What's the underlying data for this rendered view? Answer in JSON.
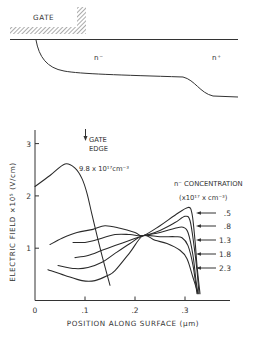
{
  "diagram": {
    "gate_label": "GATE",
    "n_minus_label": "n⁻",
    "n_plus_label": "n⁺"
  },
  "chart_data": {
    "type": "line",
    "title": "",
    "xlabel": "POSITION ALONG SURFACE (μm)",
    "ylabel": "ELECTRIC FIELD ×10⁵ (V/cm)",
    "xlim": [
      0,
      0.39
    ],
    "ylim": [
      0,
      3.25
    ],
    "grid": false,
    "xticks": [
      0,
      0.1,
      0.2,
      0.3
    ],
    "xtick_labels": [
      "0",
      ".1",
      ".2",
      ".3"
    ],
    "yticks": [
      1,
      2,
      3
    ],
    "ytick_labels": [
      "1",
      "2",
      "3"
    ],
    "annotations": {
      "gate_edge": {
        "text_line1": "GATE",
        "text_line2": "EDGE",
        "x": 0.1
      },
      "high_doping_label": "9.8 x 10¹⁷cm⁻³"
    },
    "legend": {
      "title": "n⁻ CONCENTRATION",
      "units": "(x10¹⁷ x cm⁻³)",
      "placement": "right"
    },
    "series": [
      {
        "name": "9.8",
        "label": "9.8 x 10¹⁷cm⁻³",
        "x": [
          0,
          0.03,
          0.06,
          0.08,
          0.094,
          0.104,
          0.114,
          0.124,
          0.134,
          0.142,
          0.15
        ],
        "y": [
          2.18,
          2.39,
          2.61,
          2.53,
          2.33,
          2.05,
          1.64,
          1.24,
          0.86,
          0.57,
          0.29
        ]
      },
      {
        "name": ".5",
        "label": ".5",
        "x": [
          0.03,
          0.054,
          0.084,
          0.116,
          0.14,
          0.17,
          0.2,
          0.216,
          0.25,
          0.28,
          0.306,
          0.314,
          0.32,
          0.324,
          0.33
        ],
        "y": [
          1.07,
          1.19,
          1.3,
          1.36,
          1.43,
          1.38,
          1.3,
          1.24,
          1.43,
          1.63,
          1.78,
          1.66,
          1.15,
          0.67,
          0.13
        ]
      },
      {
        "name": ".8",
        "label": ".8",
        "x": [
          0.076,
          0.1,
          0.12,
          0.16,
          0.19,
          0.216,
          0.25,
          0.28,
          0.3,
          0.31,
          0.318,
          0.324,
          0.328
        ],
        "y": [
          1.11,
          1.11,
          1.15,
          1.26,
          1.26,
          1.24,
          1.34,
          1.49,
          1.61,
          1.53,
          1.05,
          0.57,
          0.13
        ]
      },
      {
        "name": "1.3",
        "label": "1.3",
        "x": [
          0.08,
          0.106,
          0.134,
          0.16,
          0.19,
          0.216,
          0.25,
          0.28,
          0.296,
          0.306,
          0.316,
          0.322,
          0.326
        ],
        "y": [
          0.82,
          0.86,
          0.96,
          1.05,
          1.15,
          1.24,
          1.3,
          1.38,
          1.4,
          1.3,
          0.86,
          0.38,
          0.13
        ]
      },
      {
        "name": "1.8",
        "label": "1.8",
        "x": [
          0.046,
          0.08,
          0.106,
          0.134,
          0.16,
          0.19,
          0.216,
          0.25,
          0.28,
          0.294,
          0.306,
          0.316,
          0.324
        ],
        "y": [
          0.67,
          0.61,
          0.63,
          0.73,
          0.9,
          1.09,
          1.24,
          1.22,
          1.22,
          1.2,
          1.05,
          0.67,
          0.13
        ]
      },
      {
        "name": "2.3",
        "label": "2.3",
        "x": [
          0.026,
          0.06,
          0.094,
          0.12,
          0.146,
          0.16,
          0.19,
          0.216,
          0.24,
          0.264,
          0.29,
          0.304,
          0.316,
          0.326
        ],
        "y": [
          0.59,
          0.48,
          0.38,
          0.38,
          0.48,
          0.57,
          0.92,
          1.24,
          1.15,
          1.09,
          0.96,
          0.8,
          0.44,
          0.13
        ]
      }
    ]
  }
}
